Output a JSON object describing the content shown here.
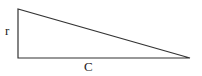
{
  "diagram": {
    "type": "right-triangle",
    "labels": {
      "vertical_side": "r",
      "base": "C"
    },
    "stroke_color": "#333333"
  }
}
